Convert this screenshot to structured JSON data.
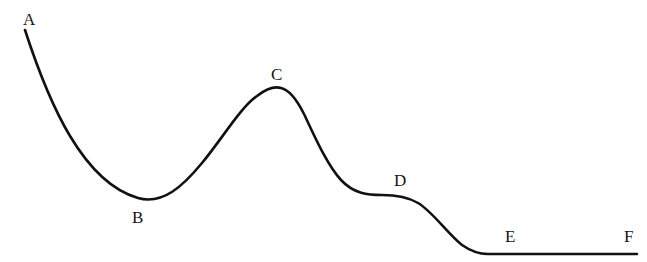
{
  "figure": {
    "kind": "line-curve-diagram",
    "width": 647,
    "height": 262,
    "background_color": "#ffffff",
    "curve_color": "#111111",
    "curve_width_px": 2.6,
    "label_color": "#151515"
  },
  "labels": [
    {
      "id": "A",
      "text": "A",
      "x": 23,
      "y": 11
    },
    {
      "id": "B",
      "text": "B",
      "x": 132,
      "y": 209
    },
    {
      "id": "C",
      "text": "C",
      "x": 271,
      "y": 66
    },
    {
      "id": "D",
      "text": "D",
      "x": 394,
      "y": 172
    },
    {
      "id": "E",
      "text": "E",
      "x": 505,
      "y": 228
    },
    {
      "id": "F",
      "text": "F",
      "x": 624,
      "y": 228
    }
  ],
  "chart_data": {
    "type": "line",
    "title": "",
    "xlabel": "",
    "ylabel": "",
    "grid": false,
    "legend": null,
    "axis_visible": false,
    "xlim": [
      0,
      647
    ],
    "ylim": [
      262,
      0
    ],
    "annotations": [
      "A",
      "B",
      "C",
      "D",
      "E",
      "F"
    ],
    "series": [
      {
        "name": "curve",
        "points": [
          {
            "label": "A",
            "x": 25,
            "y": 30
          },
          {
            "label": "",
            "x": 60,
            "y": 100
          },
          {
            "label": "",
            "x": 95,
            "y": 152
          },
          {
            "label": "B",
            "x": 138,
            "y": 198
          },
          {
            "label": "",
            "x": 180,
            "y": 186
          },
          {
            "label": "",
            "x": 225,
            "y": 140
          },
          {
            "label": "",
            "x": 258,
            "y": 100
          },
          {
            "label": "C",
            "x": 280,
            "y": 87
          },
          {
            "label": "",
            "x": 310,
            "y": 105
          },
          {
            "label": "",
            "x": 345,
            "y": 155
          },
          {
            "label": "",
            "x": 375,
            "y": 188
          },
          {
            "label": "D",
            "x": 400,
            "y": 196
          },
          {
            "label": "",
            "x": 425,
            "y": 205
          },
          {
            "label": "",
            "x": 455,
            "y": 232
          },
          {
            "label": "E",
            "x": 487,
            "y": 254
          },
          {
            "label": "F",
            "x": 637,
            "y": 254
          }
        ]
      }
    ],
    "path_segments": [
      {
        "from": "A",
        "to": "B",
        "shape": "concave-descent"
      },
      {
        "from": "B",
        "to": "C",
        "shape": "sigmoid-rise"
      },
      {
        "from": "C",
        "to": "D",
        "shape": "sigmoid-descent"
      },
      {
        "from": "D",
        "to": "E",
        "shape": "plateau-then-descent"
      },
      {
        "from": "E",
        "to": "F",
        "shape": "flat-horizontal"
      }
    ],
    "curve_path": "M 25,30 C 38,70 52,106 70,136 C 88,166 110,190 138,198 C 163,205 183,186 202,163 C 222,139 240,108 257,96 C 266,89 274,86 281,88 C 290,90 297,100 304,114 C 314,135 327,165 341,180 C 354,194 368,195 382,195 C 396,195 408,197 418,203 C 432,211 448,234 462,245 C 472,252 479,254 488,254 L 637,254"
  }
}
